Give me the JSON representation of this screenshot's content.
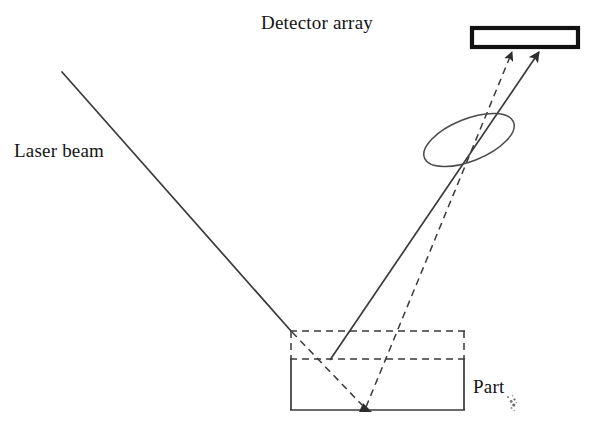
{
  "figure": {
    "title_text": "Detector array",
    "kind": "laser-triangulation-optical-diagram",
    "background_color": "#ffffff",
    "line_color": "#3a3a3a",
    "detector_border_color": "#111111",
    "text_color": "#141414",
    "canvas": {
      "width": 603,
      "height": 437
    }
  },
  "labels": {
    "detector_array": "Detector array",
    "laser_beam": "Laser beam",
    "part": "Part"
  },
  "components": {
    "detector_array": {
      "name": "Detector array",
      "shape": "rectangle",
      "x": 470,
      "y": 26,
      "width": 108,
      "height": 21,
      "stroke_width": 4,
      "fill": "#ffffff"
    },
    "lens": {
      "name": "Lens",
      "shape": "ellipse",
      "cx": 469,
      "cy": 140,
      "rx": 48,
      "ry": 21,
      "rotation_deg": -22,
      "stroke_width": 1.4
    },
    "part_solid": {
      "name": "Part body (solid outline)",
      "shape": "rectangle-open-top",
      "x": 290,
      "y": 359,
      "width": 175,
      "height": 51,
      "stroke_width": 1.6,
      "style": "solid"
    },
    "part_removed": {
      "name": "Removed / nominal material (dashed outline)",
      "shape": "rectangle",
      "x": 290,
      "y": 331,
      "width": 175,
      "height": 28,
      "stroke_width": 1.4,
      "style": "dashed"
    }
  },
  "rays": [
    {
      "id": "incident-laser",
      "name": "Incident laser beam",
      "style": "solid",
      "arrow": false,
      "from": [
        62,
        72
      ],
      "to": [
        291,
        331
      ]
    },
    {
      "id": "reflected-solid-to-detector",
      "name": "Reflected beam from nominal surface to detector",
      "style": "solid",
      "arrow": true,
      "arrow_at": "end",
      "from": [
        330,
        359
      ],
      "to": [
        541,
        49
      ]
    },
    {
      "id": "reflected-dashed-to-detector",
      "name": "Reflected beam from displaced surface to detector",
      "style": "dashed",
      "arrow": true,
      "arrow_at": "end",
      "from": [
        366,
        409
      ],
      "to": [
        513,
        49
      ]
    },
    {
      "id": "incident-dashed-into-part",
      "name": "Incident beam continued to displaced surface",
      "style": "dashed",
      "arrow": true,
      "arrow_at": "end",
      "from": [
        291,
        331
      ],
      "to": [
        366,
        409
      ]
    }
  ],
  "annotations": {
    "speckle": "scan-artifact-speckle"
  }
}
